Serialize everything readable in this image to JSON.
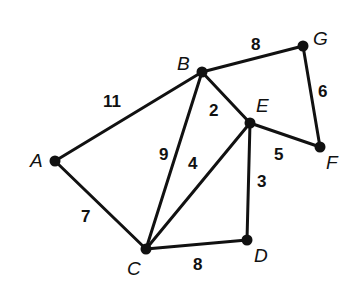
{
  "graph": {
    "nodes": [
      {
        "id": "A",
        "label": "A",
        "x": 55,
        "y": 161,
        "lx": 30,
        "ly": 167
      },
      {
        "id": "B",
        "label": "B",
        "x": 202,
        "y": 72,
        "lx": 177,
        "ly": 70
      },
      {
        "id": "C",
        "label": "C",
        "x": 146,
        "y": 249,
        "lx": 127,
        "ly": 275
      },
      {
        "id": "D",
        "label": "D",
        "x": 247,
        "y": 240,
        "lx": 254,
        "ly": 262
      },
      {
        "id": "E",
        "label": "E",
        "x": 250,
        "y": 123,
        "lx": 256,
        "ly": 112
      },
      {
        "id": "F",
        "label": "F",
        "x": 320,
        "y": 147,
        "lx": 326,
        "ly": 169
      },
      {
        "id": "G",
        "label": "G",
        "x": 303,
        "y": 46,
        "lx": 313,
        "ly": 45
      }
    ],
    "edges": [
      {
        "from": "A",
        "to": "B",
        "weight": "11",
        "lx": 103,
        "ly": 107
      },
      {
        "from": "B",
        "to": "G",
        "weight": "8",
        "lx": 251,
        "ly": 50
      },
      {
        "from": "G",
        "to": "F",
        "weight": "6",
        "lx": 318,
        "ly": 97
      },
      {
        "from": "B",
        "to": "E",
        "weight": "2",
        "lx": 209,
        "ly": 116
      },
      {
        "from": "E",
        "to": "F",
        "weight": "5",
        "lx": 274,
        "ly": 160
      },
      {
        "from": "B",
        "to": "C",
        "weight": "9",
        "lx": 159,
        "ly": 160
      },
      {
        "from": "E",
        "to": "C",
        "weight": "4",
        "lx": 188,
        "ly": 169
      },
      {
        "from": "E",
        "to": "D",
        "weight": "3",
        "lx": 257,
        "ly": 187
      },
      {
        "from": "A",
        "to": "C",
        "weight": "7",
        "lx": 81,
        "ly": 222
      },
      {
        "from": "C",
        "to": "D",
        "weight": "8",
        "lx": 193,
        "ly": 270
      }
    ]
  }
}
